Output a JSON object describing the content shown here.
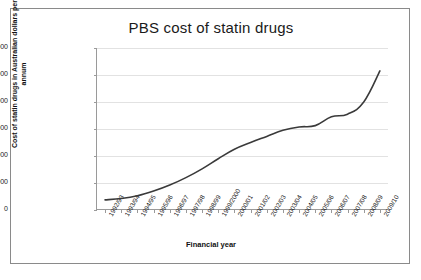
{
  "chart_data": {
    "type": "line",
    "title": "PBS cost of statin drugs",
    "xlabel": "Financial year",
    "ylabel": "Cost of statin drugs in Australian dollars per annum",
    "grid": true,
    "legend": "none",
    "ylim": [
      0,
      1200000000
    ],
    "ytick_labels": [
      "1 200 000 000",
      "1 000 000 000",
      "800 000 000",
      "600 000 000",
      "400 000 000",
      "200 000 000",
      "0"
    ],
    "ytick_values": [
      1200000000,
      1000000000,
      800000000,
      600000000,
      400000000,
      200000000,
      0
    ],
    "categories": [
      "1992/93",
      "1993/94",
      "1994/95",
      "1995/96",
      "1996/97",
      "1997/98",
      "1998/99",
      "1999/2000",
      "2000/01",
      "2001/02",
      "2002/03",
      "2003/04",
      "2004/05",
      "2005/06",
      "2006/07",
      "2007/08",
      "2008/09",
      "2009/10"
    ],
    "values": [
      75000000,
      85000000,
      105000000,
      140000000,
      185000000,
      240000000,
      305000000,
      380000000,
      450000000,
      500000000,
      545000000,
      590000000,
      615000000,
      625000000,
      690000000,
      710000000,
      800000000,
      1030000000
    ],
    "series": [
      {
        "name": "PBS cost of statin drugs",
        "color": "#3a3a3a",
        "values": [
          75000000,
          85000000,
          105000000,
          140000000,
          185000000,
          240000000,
          305000000,
          380000000,
          450000000,
          500000000,
          545000000,
          590000000,
          615000000,
          625000000,
          690000000,
          710000000,
          800000000,
          1030000000
        ]
      }
    ]
  }
}
